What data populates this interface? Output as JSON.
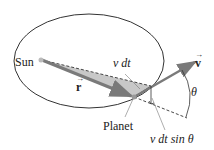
{
  "diagram": {
    "labels": {
      "sun": "Sun",
      "r_vector": "r",
      "v_vector": "v",
      "v_dt": "v dt",
      "theta": "θ",
      "planet": "Planet",
      "v_dt_sin_theta": "v dt sin θ"
    },
    "colors": {
      "ellipse": "#333333",
      "r_arrow": "#7a7a7a",
      "v_arrow": "#7a7a7a",
      "shaded_area": "#c8c8c8",
      "dashed": "#333333",
      "text": "#222222"
    }
  }
}
